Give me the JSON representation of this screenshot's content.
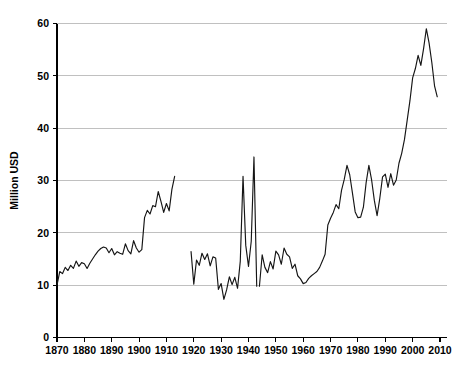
{
  "chart_data": {
    "type": "line",
    "title": "",
    "subtitle": "",
    "xlabel": "",
    "ylabel": "Million USD",
    "xlim": [
      1868,
      2011
    ],
    "ylim": [
      0,
      60
    ],
    "grid": true,
    "legend": false,
    "legend_position": "none",
    "xticks": [
      1870,
      1880,
      1890,
      1900,
      1910,
      1920,
      1930,
      1940,
      1950,
      1960,
      1970,
      1980,
      1990,
      2000,
      2010
    ],
    "yticks": [
      0,
      10,
      20,
      30,
      40,
      50,
      60
    ],
    "line_color": "#151515",
    "grid_color": "#b9b9b9",
    "axis_color": "#000000",
    "background_color": "#ffffff",
    "series": [
      {
        "name": "Million USD",
        "segments": [
          {
            "label": "1870-1913",
            "x": [
              1870,
              1871,
              1872,
              1873,
              1874,
              1875,
              1876,
              1877,
              1878,
              1879,
              1880,
              1881,
              1882,
              1883,
              1884,
              1885,
              1886,
              1887,
              1888,
              1889,
              1890,
              1891,
              1892,
              1893,
              1894,
              1895,
              1896,
              1897,
              1898,
              1899,
              1900,
              1901,
              1902,
              1903,
              1904,
              1905,
              1906,
              1907,
              1908,
              1909,
              1910,
              1911,
              1912,
              1913
            ],
            "y": [
              10.0,
              12.6,
              12.2,
              13.4,
              12.8,
              13.8,
              13.2,
              14.6,
              13.6,
              14.3,
              14.1,
              13.2,
              14.2,
              15.0,
              15.8,
              16.5,
              17.0,
              17.3,
              17.1,
              16.2,
              17.0,
              15.8,
              16.4,
              16.1,
              15.9,
              17.9,
              16.6,
              16.0,
              18.5,
              17.1,
              16.3,
              16.8,
              22.9,
              24.3,
              23.6,
              25.2,
              25.0,
              27.9,
              26.0,
              23.9,
              25.6,
              24.2,
              28.3,
              30.8
            ]
          },
          {
            "label": "1919-1943",
            "x": [
              1919,
              1920,
              1921,
              1922,
              1923,
              1924,
              1925,
              1926,
              1927,
              1928,
              1929,
              1930,
              1931,
              1932,
              1933,
              1934,
              1935,
              1936,
              1937,
              1938,
              1939,
              1940,
              1941,
              1942,
              1943
            ],
            "y": [
              16.4,
              10.2,
              14.8,
              13.8,
              16.1,
              14.9,
              16.0,
              13.7,
              15.4,
              15.2,
              9.2,
              10.3,
              7.3,
              9.1,
              11.6,
              10.1,
              11.5,
              9.4,
              14.6,
              30.8,
              17.6,
              13.6,
              18.4,
              34.5,
              9.8
            ]
          },
          {
            "label": "1944-2009",
            "x": [
              1944,
              1945,
              1946,
              1947,
              1948,
              1949,
              1950,
              1951,
              1952,
              1953,
              1954,
              1955,
              1956,
              1957,
              1958,
              1959,
              1960,
              1961,
              1962,
              1963,
              1964,
              1965,
              1966,
              1967,
              1968,
              1969,
              1970,
              1971,
              1972,
              1973,
              1974,
              1975,
              1976,
              1977,
              1978,
              1979,
              1980,
              1981,
              1982,
              1983,
              1984,
              1985,
              1986,
              1987,
              1988,
              1989,
              1990,
              1991,
              1992,
              1993,
              1994,
              1995,
              1996,
              1997,
              1998,
              1999,
              2000,
              2001,
              2002,
              2003,
              2004,
              2005,
              2006,
              2007,
              2008,
              2009
            ],
            "y": [
              9.8,
              15.8,
              13.4,
              12.4,
              14.5,
              13.1,
              16.5,
              15.8,
              14.0,
              17.1,
              15.9,
              15.4,
              13.2,
              14.0,
              11.8,
              11.2,
              10.3,
              10.5,
              11.3,
              11.8,
              12.2,
              12.6,
              13.4,
              14.6,
              15.9,
              21.5,
              22.8,
              23.9,
              25.4,
              24.6,
              28.1,
              30.2,
              32.9,
              31.1,
              27.6,
              24.0,
              22.9,
              23.0,
              24.9,
              29.6,
              32.9,
              30.1,
              26.2,
              23.3,
              26.6,
              30.7,
              31.2,
              28.7,
              31.3,
              29.1,
              30.1,
              33.3,
              35.2,
              37.8,
              41.5,
              45.2,
              49.6,
              51.4,
              53.9,
              52.0,
              55.2,
              59.0,
              56.3,
              52.6,
              48.1,
              46.0
            ]
          }
        ]
      }
    ]
  }
}
